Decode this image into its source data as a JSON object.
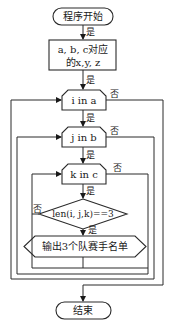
{
  "flowchart": {
    "start": "程序开始",
    "assign_line1": "a, b, c对应",
    "assign_line2": "的x,y, z",
    "loop_i": "i in a",
    "loop_j": "j in b",
    "loop_k": "k in c",
    "condition": "len(i, j,k)==3",
    "output": "输出3个队赛手名单",
    "end": "结束",
    "labels": {
      "yes": "是",
      "no": "否"
    }
  },
  "colors": {
    "line": "#2a2a2a",
    "background": "#ffffff",
    "text": "#1a1a1a"
  }
}
